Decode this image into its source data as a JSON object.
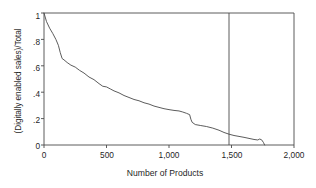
{
  "chart_data": {
    "type": "line",
    "title": "",
    "xlabel": "Number of Products",
    "ylabel": "(Digitally enabled sales)/Total",
    "xlim": [
      0,
      2000
    ],
    "ylim": [
      0,
      1
    ],
    "grid": false,
    "legend": null,
    "xticks": [
      0,
      500,
      1000,
      1500,
      2000
    ],
    "xticklabels": [
      "0",
      "500",
      "1,000",
      "1,500",
      "2,000"
    ],
    "yticks": [
      0,
      0.2,
      0.4,
      0.6,
      0.8,
      1
    ],
    "yticklabels": [
      "0",
      ".2",
      ".4",
      ".6",
      ".8",
      "1"
    ],
    "annotations": [
      {
        "type": "vertical-line",
        "x": 1480,
        "label": ""
      }
    ],
    "series": [
      {
        "name": "Digitally enabled sales share",
        "x": [
          0,
          20,
          45,
          70,
          95,
          115,
          130,
          145,
          160,
          185,
          215,
          250,
          285,
          320,
          360,
          400,
          440,
          470,
          500,
          530,
          560,
          600,
          640,
          680,
          720,
          760,
          800,
          840,
          880,
          920,
          960,
          1000,
          1040,
          1080,
          1110,
          1140,
          1165,
          1175,
          1185,
          1210,
          1250,
          1300,
          1350,
          1400,
          1440,
          1480,
          1520,
          1560,
          1600,
          1640,
          1680,
          1710,
          1725,
          1740,
          1755,
          1765
        ],
        "y": [
          1.0,
          0.935,
          0.885,
          0.845,
          0.8,
          0.755,
          0.7,
          0.655,
          0.645,
          0.625,
          0.605,
          0.59,
          0.565,
          0.545,
          0.515,
          0.495,
          0.465,
          0.445,
          0.44,
          0.425,
          0.41,
          0.395,
          0.375,
          0.36,
          0.345,
          0.335,
          0.32,
          0.31,
          0.295,
          0.285,
          0.275,
          0.268,
          0.262,
          0.258,
          0.25,
          0.24,
          0.23,
          0.195,
          0.172,
          0.155,
          0.148,
          0.14,
          0.128,
          0.112,
          0.095,
          0.082,
          0.072,
          0.065,
          0.058,
          0.05,
          0.042,
          0.038,
          0.045,
          0.04,
          0.02,
          0.0
        ]
      }
    ],
    "colors": {
      "line": "#4a4a4a",
      "frame": "#4a4a4a",
      "reference_line": "#4a4a4a",
      "background": "#ffffff",
      "text": "#1f1f1f"
    }
  }
}
